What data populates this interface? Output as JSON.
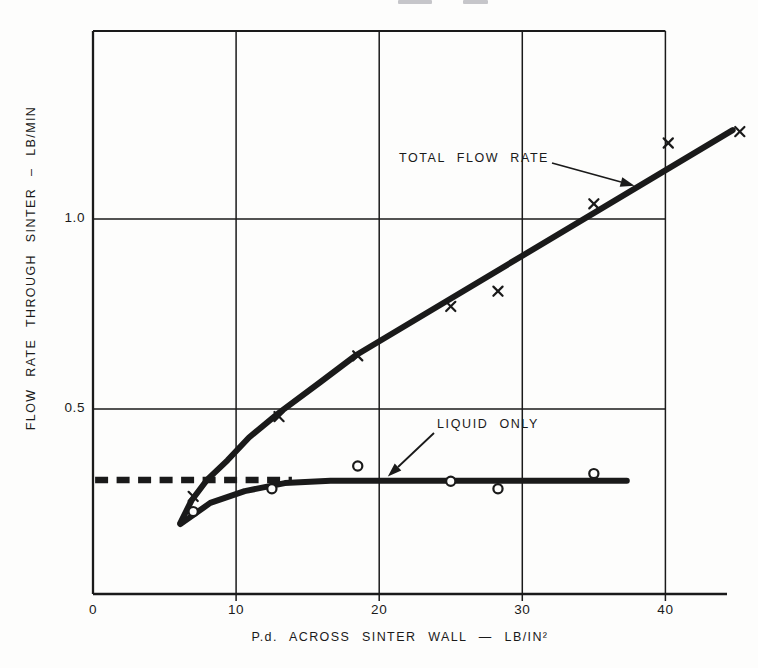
{
  "page": {
    "background": "#fdfdfc",
    "ink": "#1a1a1a"
  },
  "chart_data": {
    "type": "line",
    "title": "",
    "xlabel": "P.d. ACROSS SINTER WALL — LB/IN²",
    "ylabel": "FLOW RATE THROUGH SINTER – LB/MIN",
    "xlim": [
      0,
      44.3
    ],
    "ylim": [
      0,
      1.5
    ],
    "grid": true,
    "legend_position": "inline-annotations",
    "x_ticks": [
      {
        "value": 0,
        "label": "0"
      },
      {
        "value": 10,
        "label": "10"
      },
      {
        "value": 20,
        "label": "20"
      },
      {
        "value": 30,
        "label": "30"
      },
      {
        "value": 40,
        "label": "40"
      }
    ],
    "y_ticks": [
      {
        "value": 0.5,
        "label": "0.5"
      },
      {
        "value": 1.0,
        "label": "1.0"
      }
    ],
    "x_gridlines": [
      10,
      20,
      30,
      40
    ],
    "y_gridlines": [
      0.5,
      1.0
    ],
    "series": [
      {
        "name": "TOTAL FLOW RATE",
        "marker": "x",
        "points": [
          [
            7,
            0.27
          ],
          [
            13,
            0.48
          ],
          [
            18.5,
            0.64
          ],
          [
            25,
            0.77
          ],
          [
            28.3,
            0.81
          ],
          [
            35,
            1.04
          ],
          [
            40.2,
            1.2
          ],
          [
            45.2,
            1.23
          ]
        ],
        "curve": [
          [
            6.1,
            0.2
          ],
          [
            6.9,
            0.26
          ],
          [
            8.0,
            0.315
          ],
          [
            9.4,
            0.365
          ],
          [
            10.9,
            0.425
          ],
          [
            12.9,
            0.487
          ],
          [
            15.9,
            0.571
          ],
          [
            18.4,
            0.642
          ],
          [
            44.7,
            1.234
          ]
        ]
      },
      {
        "name": "LIQUID ONLY",
        "marker": "o",
        "points": [
          [
            7,
            0.23
          ],
          [
            12.5,
            0.29
          ],
          [
            18.5,
            0.35
          ],
          [
            25,
            0.31
          ],
          [
            28.3,
            0.29
          ],
          [
            35,
            0.33
          ]
        ],
        "curve": [
          [
            6.1,
            0.197
          ],
          [
            8.2,
            0.253
          ],
          [
            10.6,
            0.284
          ],
          [
            13.4,
            0.305
          ],
          [
            16.6,
            0.311
          ],
          [
            37.3,
            0.311
          ]
        ]
      },
      {
        "name": "liquid-only-extrapolation",
        "marker": "none",
        "style": "dashed",
        "curve": [
          [
            0.15,
            0.313
          ],
          [
            13.9,
            0.313
          ]
        ]
      }
    ],
    "annotations": [
      {
        "text": "TOTAL FLOW RATE",
        "series": "TOTAL FLOW RATE"
      },
      {
        "text": "LIQUID ONLY",
        "series": "LIQUID ONLY"
      }
    ]
  }
}
